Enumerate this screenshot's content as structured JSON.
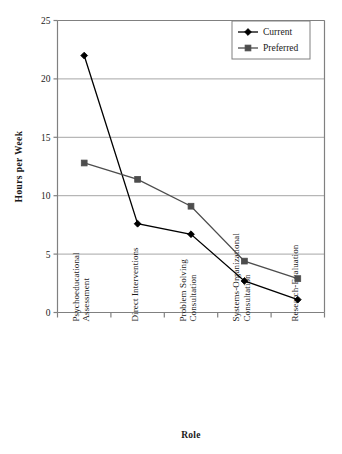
{
  "chart_data": {
    "type": "line",
    "title": "",
    "xlabel": "Role",
    "ylabel": "Hours per Week",
    "ylim": [
      0,
      25
    ],
    "yticks": [
      "0",
      "5",
      "10",
      "15",
      "20",
      "25"
    ],
    "grid": true,
    "legend_position": "top-right",
    "categories": [
      "Psychoeducational Assessment",
      "Direct Interventions",
      "Problem Solving Consultation",
      "Systems-Organizational Consultation",
      "Research-Evaluation"
    ],
    "category_lines": [
      [
        "Psychoeducational",
        "Assessment"
      ],
      [
        "Direct Interventions"
      ],
      [
        "Problem Solving",
        "Consultation"
      ],
      [
        "Systems-Organizational",
        "Consultation"
      ],
      [
        "Research-Evaluation"
      ]
    ],
    "series": [
      {
        "name": "Current",
        "marker": "diamond",
        "color": "#000000",
        "values": [
          22.0,
          7.6,
          6.7,
          2.7,
          1.1
        ]
      },
      {
        "name": "Preferred",
        "marker": "square",
        "color": "#4d4d4d",
        "values": [
          12.8,
          11.4,
          9.1,
          4.4,
          2.9
        ]
      }
    ]
  },
  "colors": {
    "axis": "#808080",
    "grid": "#a6a6a6",
    "plot_background": "#ffffff",
    "series_current": "#000000",
    "series_preferred": "#4d4d4d",
    "legend_border": "#808080"
  },
  "legend": {
    "items": [
      {
        "label": "Current",
        "marker": "diamond-marker"
      },
      {
        "label": "Preferred",
        "marker": "square-marker"
      }
    ]
  }
}
